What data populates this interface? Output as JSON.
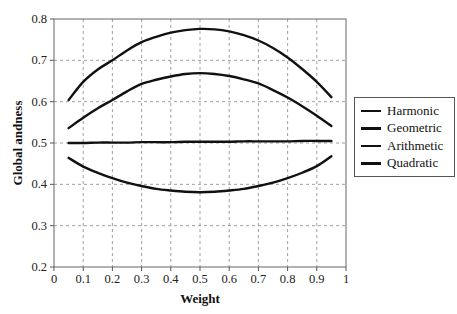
{
  "chart_data": {
    "type": "line",
    "title": "",
    "xlabel": "Weight",
    "ylabel": "Global andness",
    "xlim": [
      0,
      1
    ],
    "ylim": [
      0.2,
      0.8
    ],
    "xticks": [
      "0",
      "0.1",
      "0.2",
      "0.3",
      "0.4",
      "0.5",
      "0.6",
      "0.7",
      "0.8",
      "0.9",
      "1"
    ],
    "yticks": [
      "0.2",
      "0.3",
      "0.4",
      "0.5",
      "0.6",
      "0.7",
      "0.8"
    ],
    "grid": true,
    "legend_position": "right",
    "x": [
      0.05,
      0.1,
      0.15,
      0.2,
      0.25,
      0.3,
      0.35,
      0.4,
      0.45,
      0.5,
      0.55,
      0.6,
      0.65,
      0.7,
      0.75,
      0.8,
      0.85,
      0.9,
      0.95
    ],
    "series": [
      {
        "name": "Harmonic",
        "values": [
          0.464,
          0.443,
          0.428,
          0.415,
          0.404,
          0.396,
          0.389,
          0.385,
          0.382,
          0.381,
          0.382,
          0.385,
          0.389,
          0.396,
          0.404,
          0.415,
          0.428,
          0.444,
          0.468
        ]
      },
      {
        "name": "Geometric",
        "values": [
          0.536,
          0.561,
          0.584,
          0.604,
          0.625,
          0.643,
          0.653,
          0.661,
          0.667,
          0.669,
          0.667,
          0.662,
          0.654,
          0.644,
          0.628,
          0.61,
          0.589,
          0.566,
          0.541
        ]
      },
      {
        "name": "Arithmetic",
        "values": [
          0.5,
          0.5,
          0.501,
          0.501,
          0.501,
          0.502,
          0.502,
          0.502,
          0.503,
          0.503,
          0.503,
          0.503,
          0.504,
          0.504,
          0.504,
          0.504,
          0.505,
          0.505,
          0.505
        ]
      },
      {
        "name": "Quadratic",
        "values": [
          0.604,
          0.648,
          0.678,
          0.7,
          0.724,
          0.744,
          0.757,
          0.767,
          0.773,
          0.776,
          0.775,
          0.77,
          0.761,
          0.748,
          0.73,
          0.707,
          0.679,
          0.648,
          0.611
        ]
      }
    ]
  }
}
